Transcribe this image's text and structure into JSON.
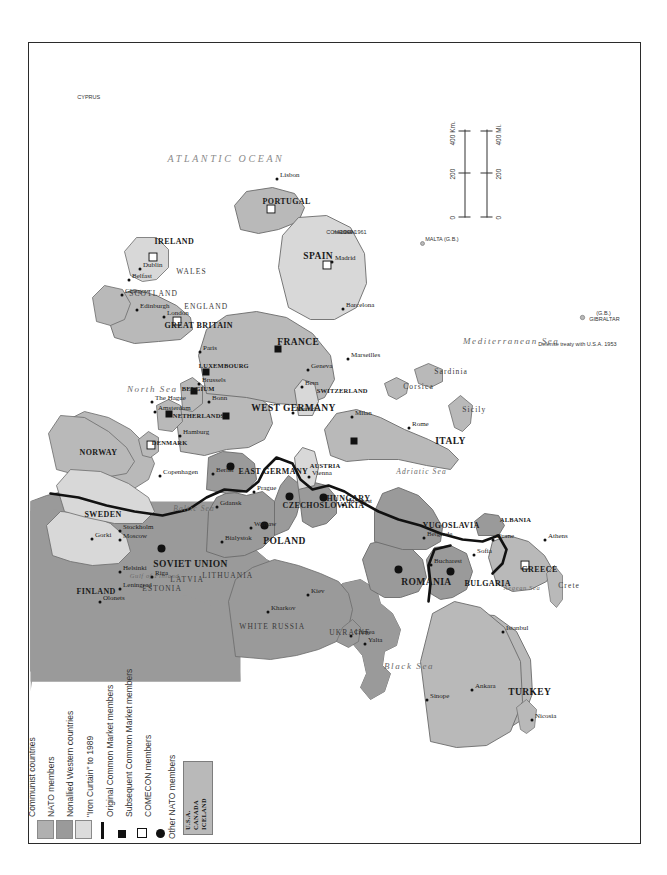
{
  "map": {
    "title": "Cold War Europe",
    "orientation": "rotated-90",
    "colors": {
      "communist": "#9a9a9a",
      "nato": "#b9b9b9",
      "nonallied": "#d8d8d8",
      "water": "#ffffff",
      "iron_curtain": "#111111",
      "border": "#6b6b6b",
      "frame": "#2b2b2b"
    }
  },
  "legend": {
    "items": [
      {
        "label": "Communist countries",
        "symbol": "swatch",
        "color": "#b0b0b0"
      },
      {
        "label": "NATO members",
        "symbol": "swatch",
        "color": "#9a9a9a"
      },
      {
        "label": "Nonallied Western countries",
        "symbol": "swatch",
        "color": "#dcdcdc"
      },
      {
        "label": "\"Iron Curtain\" to 1989",
        "symbol": "bar",
        "color": "#111111"
      },
      {
        "label": "Original Common Market members",
        "symbol": "filled-square",
        "color": "#111111"
      },
      {
        "label": "Subsequent Common Market members",
        "symbol": "open-square",
        "color": "#111111"
      },
      {
        "label": "COMECON members",
        "symbol": "filled-circle",
        "color": "#111111"
      }
    ],
    "other_nato": {
      "heading": "Other NATO members",
      "members": [
        "U.S.A.",
        "CANADA",
        "ICELAND"
      ]
    }
  },
  "scale": {
    "km_label": "400 Km.",
    "km_ticks": [
      "0",
      "200",
      "400"
    ],
    "mi_label": "400 Mi.",
    "mi_ticks": [
      "0",
      "200",
      "400"
    ]
  },
  "annotations": [
    {
      "text": "COMECON",
      "x": 609,
      "y": 293
    },
    {
      "text": "member",
      "x": 609,
      "y": 300
    },
    {
      "text": "1949-1961",
      "x": 609,
      "y": 307
    },
    {
      "text": "Defense treaty with U.S.A. 1953",
      "x": 497,
      "y": 505
    },
    {
      "text": "GIBRALTAR",
      "x": 522,
      "y": 556
    },
    {
      "text": "(G.B.)",
      "x": 528,
      "y": 563
    },
    {
      "text": "MALTA (G.B.)",
      "x": 602,
      "y": 392
    },
    {
      "text": "CYPRUS",
      "x": 744,
      "y": 44
    }
  ],
  "countries": [
    {
      "name": "SOVIET UNION",
      "x": 277,
      "y": 118,
      "cls": "country"
    },
    {
      "name": "FINLAND",
      "x": 250,
      "y": 42,
      "cls": "country sm"
    },
    {
      "name": "SWEDEN",
      "x": 327,
      "y": 50,
      "cls": "country sm"
    },
    {
      "name": "NORWAY",
      "x": 389,
      "y": 45,
      "cls": "country sm"
    },
    {
      "name": "ESTONIA",
      "x": 253,
      "y": 108,
      "cls": "region"
    },
    {
      "name": "LATVIA",
      "x": 262,
      "y": 136,
      "cls": "region"
    },
    {
      "name": "LITHUANIA",
      "x": 266,
      "y": 168,
      "cls": "region"
    },
    {
      "name": "WHITE RUSSIA",
      "x": 215,
      "y": 205,
      "cls": "region"
    },
    {
      "name": "UKRAINE",
      "x": 209,
      "y": 295,
      "cls": "region"
    },
    {
      "name": "POLAND",
      "x": 300,
      "y": 228,
      "cls": "country"
    },
    {
      "name": "CZECHOSLOVAKIA",
      "x": 336,
      "y": 248,
      "cls": "country sm"
    },
    {
      "name": "HUNGARY",
      "x": 343,
      "y": 292,
      "cls": "country sm"
    },
    {
      "name": "ROMANIA",
      "x": 259,
      "y": 366,
      "cls": "country"
    },
    {
      "name": "BULGARIA",
      "x": 258,
      "y": 430,
      "cls": "country sm"
    },
    {
      "name": "YUGOSLAVIA",
      "x": 316,
      "y": 388,
      "cls": "country sm"
    },
    {
      "name": "ALBANIA",
      "x": 321,
      "y": 466,
      "cls": "country xs"
    },
    {
      "name": "GREECE",
      "x": 272,
      "y": 487,
      "cls": "country sm"
    },
    {
      "name": "TURKEY",
      "x": 149,
      "y": 473,
      "cls": "country"
    },
    {
      "name": "AUSTRIA",
      "x": 375,
      "y": 276,
      "cls": "country xs"
    },
    {
      "name": "EAST GERMANY",
      "x": 370,
      "y": 204,
      "cls": "country sm"
    },
    {
      "name": "WEST GERMANY",
      "x": 433,
      "y": 216,
      "cls": "country"
    },
    {
      "name": "SWITZERLAND",
      "x": 450,
      "y": 283,
      "cls": "country xs"
    },
    {
      "name": "ITALY",
      "x": 400,
      "y": 400,
      "cls": "country"
    },
    {
      "name": "FRANCE",
      "x": 499,
      "y": 242,
      "cls": "country"
    },
    {
      "name": "NETHERLANDS",
      "x": 425,
      "y": 139,
      "cls": "country xs"
    },
    {
      "name": "BELGIUM",
      "x": 452,
      "y": 148,
      "cls": "country xs"
    },
    {
      "name": "LUXEMBOURG",
      "x": 475,
      "y": 165,
      "cls": "country xs"
    },
    {
      "name": "GREAT BRITAIN",
      "x": 516,
      "y": 130,
      "cls": "country sm"
    },
    {
      "name": "ENGLAND",
      "x": 535,
      "y": 150,
      "cls": "region"
    },
    {
      "name": "SCOTLAND",
      "x": 548,
      "y": 95,
      "cls": "region"
    },
    {
      "name": "WALES",
      "x": 570,
      "y": 142,
      "cls": "region"
    },
    {
      "name": "IRELAND",
      "x": 600,
      "y": 120,
      "cls": "country sm"
    },
    {
      "name": "DENMARK",
      "x": 398,
      "y": 118,
      "cls": "country xs"
    },
    {
      "name": "SPAIN",
      "x": 585,
      "y": 268,
      "cls": "country"
    },
    {
      "name": "PORTUGAL",
      "x": 640,
      "y": 228,
      "cls": "country sm"
    }
  ],
  "cities": [
    {
      "name": "Moscow",
      "x": 300,
      "y": 88,
      "side": "left"
    },
    {
      "name": "Gorki",
      "x": 301,
      "y": 60,
      "side": "left"
    },
    {
      "name": "Leningrad",
      "x": 251,
      "y": 88,
      "side": "left"
    },
    {
      "name": "Olonets",
      "x": 238,
      "y": 68,
      "side": "left"
    },
    {
      "name": "Helsinki",
      "x": 268,
      "y": 88,
      "side": "left"
    },
    {
      "name": "Stockholm",
      "x": 309,
      "y": 88,
      "side": "left"
    },
    {
      "name": "Riga",
      "x": 263,
      "y": 120,
      "side": "left"
    },
    {
      "name": "Kiev",
      "x": 245,
      "y": 276,
      "side": "left"
    },
    {
      "name": "Kharkov",
      "x": 228,
      "y": 236,
      "side": "left"
    },
    {
      "name": "Yalta",
      "x": 196,
      "y": 333,
      "side": "left"
    },
    {
      "name": "Crimea",
      "x": 204,
      "y": 319,
      "side": "left"
    },
    {
      "name": "Sinope",
      "x": 140,
      "y": 395,
      "side": "left"
    },
    {
      "name": "Ankara",
      "x": 150,
      "y": 440,
      "side": "left"
    },
    {
      "name": "Istanbul",
      "x": 208,
      "y": 471,
      "side": "left"
    },
    {
      "name": "Nicosia",
      "x": 120,
      "y": 500,
      "side": "left"
    },
    {
      "name": "Athens",
      "x": 300,
      "y": 513,
      "side": "left"
    },
    {
      "name": "Tirane",
      "x": 300,
      "y": 461,
      "side": "left"
    },
    {
      "name": "Sofia",
      "x": 285,
      "y": 442,
      "side": "left"
    },
    {
      "name": "Bucharest",
      "x": 275,
      "y": 399,
      "side": "left"
    },
    {
      "name": "Belgrade",
      "x": 302,
      "y": 392,
      "side": "left"
    },
    {
      "name": "Budapest",
      "x": 335,
      "y": 311,
      "side": "left"
    },
    {
      "name": "Prague",
      "x": 348,
      "y": 222,
      "side": "left"
    },
    {
      "name": "Vienna",
      "x": 363,
      "y": 277,
      "side": "left"
    },
    {
      "name": "Warsaw",
      "x": 312,
      "y": 219,
      "side": "left"
    },
    {
      "name": "Gdansk",
      "x": 333,
      "y": 185,
      "side": "left"
    },
    {
      "name": "Bialystok",
      "x": 298,
      "y": 190,
      "side": "left"
    },
    {
      "name": "Copenhagen",
      "x": 364,
      "y": 128,
      "side": "left"
    },
    {
      "name": "Berlin",
      "x": 366,
      "y": 181,
      "side": "left"
    },
    {
      "name": "Hamburg",
      "x": 404,
      "y": 148,
      "side": "left"
    },
    {
      "name": "Bonn",
      "x": 438,
      "y": 177,
      "side": "left"
    },
    {
      "name": "Brussels",
      "x": 456,
      "y": 167,
      "side": "left"
    },
    {
      "name": "Amsterdam",
      "x": 428,
      "y": 123,
      "side": "left"
    },
    {
      "name": "The Hague",
      "x": 438,
      "y": 120,
      "side": "left"
    },
    {
      "name": "Paris",
      "x": 488,
      "y": 168,
      "side": "left"
    },
    {
      "name": "London",
      "x": 523,
      "y": 132,
      "side": "left"
    },
    {
      "name": "Edinburgh",
      "x": 530,
      "y": 105,
      "side": "left"
    },
    {
      "name": "Glasgow",
      "x": 545,
      "y": 90,
      "side": "left"
    },
    {
      "name": "Belfast",
      "x": 560,
      "y": 97,
      "side": "left"
    },
    {
      "name": "Dublin",
      "x": 571,
      "y": 108,
      "side": "left"
    },
    {
      "name": "Munich",
      "x": 427,
      "y": 261,
      "side": "left"
    },
    {
      "name": "Bern",
      "x": 453,
      "y": 270,
      "side": "left"
    },
    {
      "name": "Geneva",
      "x": 470,
      "y": 276,
      "side": "left"
    },
    {
      "name": "Milan",
      "x": 423,
      "y": 320,
      "side": "left"
    },
    {
      "name": "Marseilles",
      "x": 481,
      "y": 316,
      "side": "left"
    },
    {
      "name": "Rome",
      "x": 412,
      "y": 377,
      "side": "left"
    },
    {
      "name": "Barcelona",
      "x": 531,
      "y": 311,
      "side": "left"
    },
    {
      "name": "Madrid",
      "x": 578,
      "y": 300,
      "side": "left"
    },
    {
      "name": "Lisbon",
      "x": 661,
      "y": 245,
      "side": "left"
    }
  ],
  "seas": [
    {
      "name": "ATLANTIC OCEAN",
      "x": 683,
      "y": 132,
      "cls": "ocean"
    },
    {
      "name": "North Sea",
      "x": 452,
      "y": 92,
      "cls": "sea"
    },
    {
      "name": "Baltic Sea",
      "x": 333,
      "y": 139,
      "cls": "sea sm"
    },
    {
      "name": "Gulf of Finland",
      "x": 265,
      "y": 96,
      "cls": "sea xs"
    },
    {
      "name": "Black Sea",
      "x": 175,
      "y": 349,
      "cls": "sea"
    },
    {
      "name": "Mediterranean Sea",
      "x": 500,
      "y": 428,
      "cls": "sea"
    },
    {
      "name": "Adriatic Sea",
      "x": 370,
      "y": 362,
      "cls": "sea sm"
    },
    {
      "name": "Aegean Sea",
      "x": 253,
      "y": 470,
      "cls": "sea xs"
    },
    {
      "name": "Sicily",
      "x": 432,
      "y": 428,
      "cls": "region"
    },
    {
      "name": "Sardinia",
      "x": 470,
      "y": 400,
      "cls": "region"
    },
    {
      "name": "Corsica",
      "x": 455,
      "y": 369,
      "cls": "region"
    },
    {
      "name": "Crete",
      "x": 256,
      "y": 524,
      "cls": "region"
    }
  ]
}
